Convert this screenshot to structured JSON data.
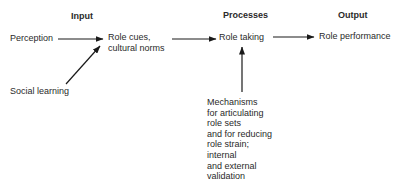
{
  "headers": {
    "input": "Input",
    "processes": "Processes",
    "output": "Output"
  },
  "nodes": {
    "perception": "Perception",
    "social_learning": "Social learning",
    "role_cues": "Role cues,\ncultural norms",
    "role_taking": "Role taking",
    "role_performance": "Role performance",
    "mechanisms": "Mechanisms\nfor articulating\nrole sets\nand for reducing\nrole strain;\ninternal\nand external\nvalidation"
  },
  "edges": [
    {
      "from": "perception",
      "to": "role_cues"
    },
    {
      "from": "social_learning",
      "to": "role_cues"
    },
    {
      "from": "role_cues",
      "to": "role_taking"
    },
    {
      "from": "role_taking",
      "to": "role_performance"
    },
    {
      "from": "mechanisms",
      "to": "role_taking"
    }
  ],
  "colors": {
    "text": "#2a2a2a",
    "arrow": "#1a1a1a",
    "background": "#ffffff"
  }
}
